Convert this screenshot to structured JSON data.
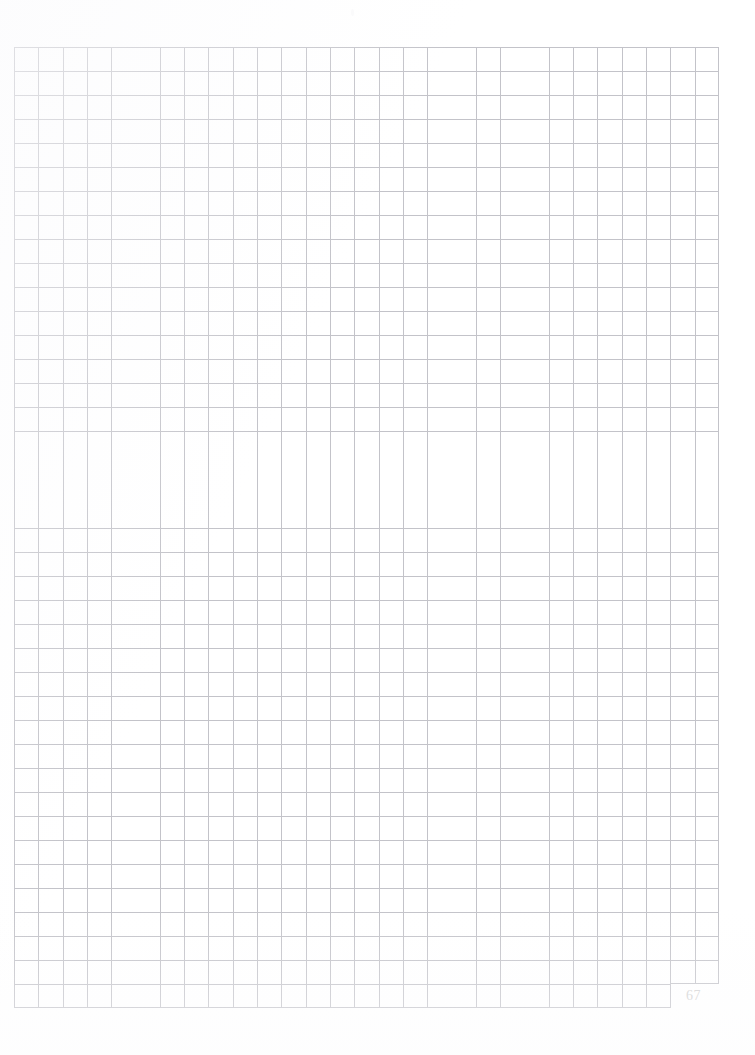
{
  "document": {
    "type": "grid-paper-page",
    "page_number": "67",
    "background_color": "#ffffff",
    "grid": {
      "line_color": "#c3c3c9",
      "columns": 29,
      "rows": 40,
      "cell_width_px": 24.31,
      "cell_height_px": 24.03,
      "left_px": 14,
      "top_px": 47,
      "width_px": 705,
      "height_px": 961,
      "corner_notch": {
        "position": "bottom-right",
        "width_px": 48,
        "height_px": 24
      }
    },
    "content": {
      "body_text": "",
      "annotations": []
    }
  }
}
